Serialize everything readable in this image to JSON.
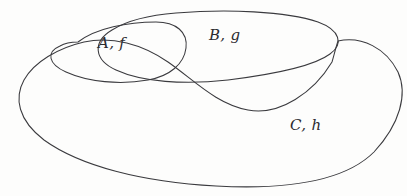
{
  "figure": {
    "kind": "set-diagram",
    "background_color": "#fdfdfc",
    "stroke_color": "#3a3a3e",
    "label_color": "#2b2b2f",
    "width": 407,
    "height": 196
  },
  "regions": [
    {
      "id": "A",
      "label": "A, f",
      "set_name": "A",
      "function_name": "f",
      "shape": "small tilted oval, upper left"
    },
    {
      "id": "B",
      "label": "B, g",
      "set_name": "B",
      "function_name": "g",
      "shape": "wide elongated blob across the top"
    },
    {
      "id": "C",
      "label": "C, h",
      "set_name": "C",
      "function_name": "h",
      "shape": "large outer blob enclosing the lower area"
    }
  ]
}
